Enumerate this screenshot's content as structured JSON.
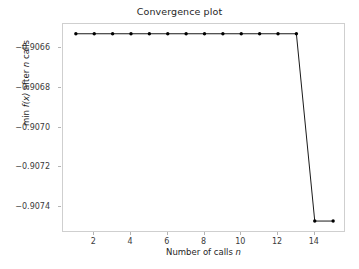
{
  "chart_data": {
    "type": "line",
    "title": "Convergence plot",
    "xlabel": "Number of calls n",
    "ylabel": "min f(x) after n calls",
    "xlabel_parts": {
      "text": "Number of calls ",
      "italic": "n"
    },
    "ylabel_parts": {
      "pre": "min ",
      "fn": "f(x)",
      "mid": " after ",
      "italic": "n",
      "post": " calls"
    },
    "x": [
      1,
      2,
      3,
      4,
      5,
      6,
      7,
      8,
      9,
      10,
      11,
      12,
      13,
      14,
      15
    ],
    "values": [
      -0.906529,
      -0.906529,
      -0.906529,
      -0.906529,
      -0.906529,
      -0.906529,
      -0.906529,
      -0.906529,
      -0.906529,
      -0.906529,
      -0.906529,
      -0.906529,
      -0.906529,
      -0.90747,
      -0.90747
    ],
    "series": [
      {
        "name": "min f(x) after n calls",
        "values": [
          -0.906529,
          -0.906529,
          -0.906529,
          -0.906529,
          -0.906529,
          -0.906529,
          -0.906529,
          -0.906529,
          -0.906529,
          -0.906529,
          -0.906529,
          -0.906529,
          -0.906529,
          -0.90747,
          -0.90747
        ]
      }
    ],
    "xlim": [
      0.3,
      15.7
    ],
    "ylim": [
      -0.90753,
      -0.90648
    ],
    "xticks": [
      2,
      4,
      6,
      8,
      10,
      12,
      14
    ],
    "xticklabels": [
      "2",
      "4",
      "6",
      "8",
      "10",
      "12",
      "14"
    ],
    "yticks": [
      -0.9066,
      -0.9068,
      -0.907,
      -0.9072,
      -0.9074
    ],
    "yticklabels": [
      "−0.9066",
      "−0.9068",
      "−0.9070",
      "−0.9072",
      "−0.9074"
    ],
    "grid": false,
    "legend": null,
    "line_color": "#1a1a1a",
    "marker": "circle",
    "marker_color": "#000000",
    "frame_color": "#cfcfcf",
    "background_color": "#ffffff",
    "text_color": "#262626"
  }
}
